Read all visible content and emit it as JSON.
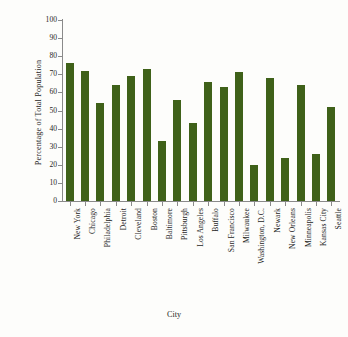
{
  "chart_data": {
    "type": "bar",
    "title": "",
    "xlabel": "City",
    "ylabel": "Percentage of  Total Population",
    "ylim": [
      0,
      100
    ],
    "ytick_labels": [
      "100",
      "90",
      "80",
      "70",
      "60",
      "50",
      "40",
      "30",
      "20",
      "10",
      "0"
    ],
    "ytick_values": [
      100,
      90,
      80,
      70,
      60,
      50,
      40,
      30,
      20,
      10,
      0
    ],
    "grid": false,
    "legend": null,
    "bar_color": "#3f6119",
    "axis_color": "#8a8a8a",
    "background_color": "#fdfdfb",
    "categories": [
      "New York",
      "Chicago",
      "Philadelphia",
      "Detroit",
      "Cleveland",
      "Boston",
      "Baltimore",
      "Pittsburgh",
      "Los Angeles",
      "Buffalo",
      "San Francisco",
      "Milwaukee",
      "Washington, D.C.",
      "Newark",
      "New Orleans",
      "Minneapolis",
      "Kansas City",
      "Seattle"
    ],
    "values": [
      76,
      72,
      54,
      64,
      69,
      73,
      33,
      56,
      43,
      66,
      63,
      71,
      20,
      68,
      24,
      64,
      26,
      52
    ]
  }
}
